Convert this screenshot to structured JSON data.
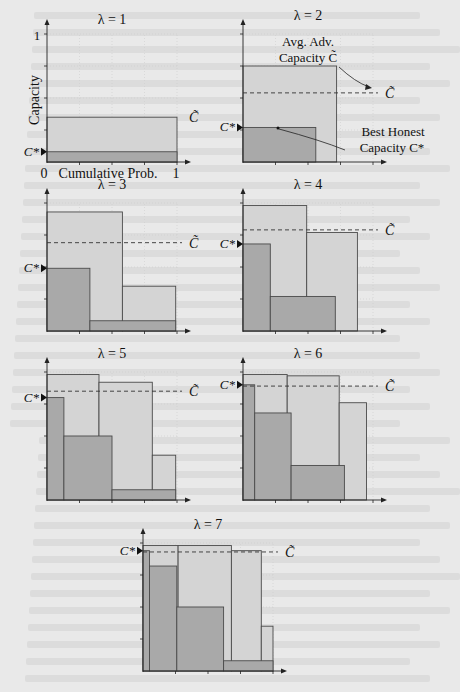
{
  "figure": {
    "x_axis_label": "Cumulative Prob.",
    "y_axis_label": "Capacity",
    "x_tick_start": "0",
    "x_tick_end": "1",
    "y_tick_top": "1",
    "c_star_label": "C*",
    "c_tilde_label": "C̃",
    "annotation_avg_adv": [
      "Avg. Adv.",
      "Capacity  C̃"
    ],
    "annotation_best_honest": [
      "Best Honest",
      "Capacity  C*"
    ],
    "colors": {
      "light_bar": "#d4d4d4",
      "dark_bar": "#a9a9a9",
      "edge": "#4a4a4a",
      "background": "#e9e9e9"
    }
  },
  "chart_data": [
    {
      "type": "bar",
      "title": "λ = 1",
      "xlabel": "Cumulative Prob.",
      "ylabel": "Capacity",
      "xlim": [
        0,
        1
      ],
      "ylim": [
        0,
        1
      ],
      "grid": true,
      "adversarial_bars": [
        {
          "x0": 0,
          "x1": 1.0,
          "h": 0.35
        }
      ],
      "honest_bars": [
        {
          "x0": 0,
          "x1": 1.0,
          "h": 0.08
        }
      ],
      "c_tilde": 0.35,
      "c_star": 0.08
    },
    {
      "type": "bar",
      "title": "λ = 2",
      "xlim": [
        0,
        1
      ],
      "ylim": [
        0,
        1
      ],
      "grid": true,
      "adversarial_bars": [
        {
          "x0": 0,
          "x1": 0.72,
          "h": 0.75
        }
      ],
      "honest_bars": [
        {
          "x0": 0,
          "x1": 0.56,
          "h": 0.27
        }
      ],
      "c_tilde": 0.54,
      "c_star": 0.27
    },
    {
      "type": "bar",
      "title": "λ = 3",
      "xlim": [
        0,
        1
      ],
      "ylim": [
        0,
        1
      ],
      "grid": true,
      "adversarial_bars": [
        {
          "x0": 0,
          "x1": 0.58,
          "h": 0.93
        },
        {
          "x0": 0.58,
          "x1": 0.99,
          "h": 0.35
        }
      ],
      "honest_bars": [
        {
          "x0": 0,
          "x1": 0.33,
          "h": 0.49
        },
        {
          "x0": 0.33,
          "x1": 0.99,
          "h": 0.08
        }
      ],
      "c_tilde": 0.69,
      "c_star": 0.49
    },
    {
      "type": "bar",
      "title": "λ = 4",
      "xlim": [
        0,
        1
      ],
      "ylim": [
        0,
        1
      ],
      "grid": true,
      "adversarial_bars": [
        {
          "x0": 0,
          "x1": 0.49,
          "h": 0.98
        },
        {
          "x0": 0.49,
          "x1": 0.88,
          "h": 0.77
        }
      ],
      "honest_bars": [
        {
          "x0": 0,
          "x1": 0.21,
          "h": 0.68
        },
        {
          "x0": 0.21,
          "x1": 0.71,
          "h": 0.27
        }
      ],
      "c_tilde": 0.79,
      "c_star": 0.68
    },
    {
      "type": "bar",
      "title": "λ = 5",
      "xlim": [
        0,
        1
      ],
      "ylim": [
        0,
        1
      ],
      "grid": true,
      "adversarial_bars": [
        {
          "x0": 0,
          "x1": 0.4,
          "h": 0.98
        },
        {
          "x0": 0.4,
          "x1": 0.81,
          "h": 0.92
        },
        {
          "x0": 0.81,
          "x1": 0.99,
          "h": 0.35
        }
      ],
      "honest_bars": [
        {
          "x0": 0,
          "x1": 0.13,
          "h": 0.8
        },
        {
          "x0": 0.13,
          "x1": 0.5,
          "h": 0.5
        },
        {
          "x0": 0.5,
          "x1": 0.99,
          "h": 0.08
        }
      ],
      "c_tilde": 0.85,
      "c_star": 0.8
    },
    {
      "type": "bar",
      "title": "λ = 6",
      "xlim": [
        0,
        1
      ],
      "ylim": [
        0,
        1
      ],
      "grid": true,
      "adversarial_bars": [
        {
          "x0": 0,
          "x1": 0.34,
          "h": 0.98
        },
        {
          "x0": 0.34,
          "x1": 0.74,
          "h": 0.97
        },
        {
          "x0": 0.74,
          "x1": 0.95,
          "h": 0.76
        }
      ],
      "honest_bars": [
        {
          "x0": 0,
          "x1": 0.09,
          "h": 0.9
        },
        {
          "x0": 0.09,
          "x1": 0.37,
          "h": 0.68
        },
        {
          "x0": 0.37,
          "x1": 0.78,
          "h": 0.27
        }
      ],
      "c_tilde": 0.89,
      "c_star": 0.9
    },
    {
      "type": "bar",
      "title": "λ = 7",
      "xlim": [
        0,
        1
      ],
      "ylim": [
        0,
        1
      ],
      "grid": true,
      "adversarial_bars": [
        {
          "x0": 0,
          "x1": 0.27,
          "h": 0.98
        },
        {
          "x0": 0.27,
          "x1": 0.68,
          "h": 0.98
        },
        {
          "x0": 0.68,
          "x1": 0.91,
          "h": 0.94
        },
        {
          "x0": 0.91,
          "x1": 1.0,
          "h": 0.35
        }
      ],
      "honest_bars": [
        {
          "x0": 0,
          "x1": 0.05,
          "h": 0.94
        },
        {
          "x0": 0.05,
          "x1": 0.26,
          "h": 0.82
        },
        {
          "x0": 0.26,
          "x1": 0.62,
          "h": 0.5
        },
        {
          "x0": 0.62,
          "x1": 1.0,
          "h": 0.08
        }
      ],
      "c_tilde": 0.93,
      "c_star": 0.94
    }
  ]
}
